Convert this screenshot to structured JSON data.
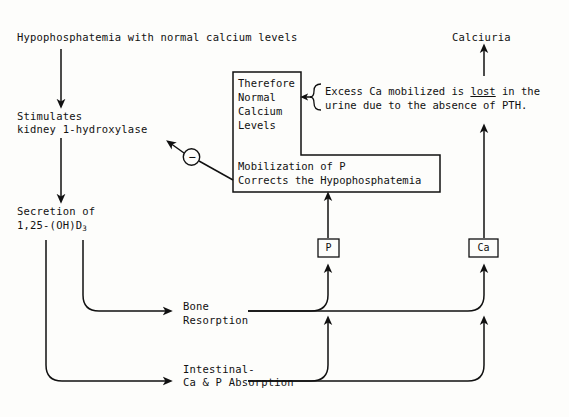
{
  "diagram": {
    "title_top_left": "Hypophosphatemia with normal calcium levels",
    "title_top_right": "Calciuria",
    "nodes": {
      "stimulates_line1": "Stimulates",
      "stimulates_line2": "kidney 1-hydroxylase",
      "secretion_line1": "Secretion of",
      "secretion_line2_pre": "1,25-(OH)D",
      "secretion_line2_sub": "3",
      "bone_line1": "Bone",
      "bone_line2": "Resorption",
      "intestinal_line1": "Intestinal-",
      "intestinal_line2": "Ca & P Absorption"
    },
    "step_box": {
      "upper_line1": "Therefore",
      "upper_line2": "Normal",
      "upper_line3": "Calcium",
      "upper_line4": "Levels",
      "lower_line1": "Mobilization of P",
      "lower_line2": "Corrects the Hypophosphatemia"
    },
    "tokens": {
      "phosphorus": "P",
      "calcium": "Ca"
    },
    "annotation": {
      "line1_a": "Excess Ca mobilized is ",
      "line1_underlined": "lost",
      "line1_b": " in the",
      "line2": "urine due to the absence of PTH."
    },
    "inhibition_symbol": "−",
    "colors": {
      "ink": "#111111",
      "paper": "#fdfdfb"
    }
  }
}
